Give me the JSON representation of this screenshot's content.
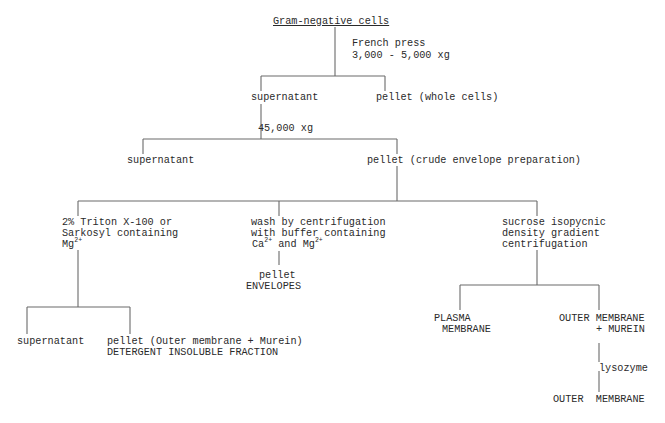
{
  "diagram": {
    "type": "flowchart",
    "title": "Gram-negative cells",
    "nodes": {
      "root": {
        "label": "Gram-negative cells"
      },
      "step1": {
        "line1": "French press",
        "line2": "3,000 - 5,000 xg"
      },
      "sup1": {
        "label": "supernatant"
      },
      "pellet1": {
        "label": "pellet (whole cells)"
      },
      "step2": {
        "label": "45,000 xg"
      },
      "sup2": {
        "label": "supernatant"
      },
      "pellet2": {
        "label": "pellet (crude envelope preparation)"
      },
      "branchA": {
        "line1": "2% Triton X-100 or",
        "line2": "Sarkosyl containing",
        "line3_base": "Mg",
        "line3_sup": "2+"
      },
      "branchB": {
        "line1": "wash by centrifugation",
        "line2": "with buffer containing",
        "line3_a": "Ca",
        "line3_a_sup": "2+",
        "line3_mid": " and",
        "line3_b": "Mg",
        "line3_b_sup": "2+"
      },
      "branchC": {
        "line1": "sucrose isopycnic",
        "line2": "density gradient",
        "line3": "centrifugation"
      },
      "supA": {
        "label": "supernatant"
      },
      "pelletA": {
        "line1": "pellet (Outer membrane + Murein)",
        "line2": "DETERGENT INSOLUBLE FRACTION"
      },
      "pelletB": {
        "line1": "pellet",
        "line2": "ENVELOPES"
      },
      "plasma": {
        "line1": "PLASMA",
        "line2": "MEMBRANE"
      },
      "outerMurein": {
        "line1": "OUTER MEMBRANE",
        "line2": "+ MUREIN"
      },
      "step3": {
        "label": "lysozyme"
      },
      "outer": {
        "label": "OUTER  MEMBRANE"
      }
    },
    "edges": [
      [
        "root",
        "sup1"
      ],
      [
        "root",
        "pellet1"
      ],
      [
        "sup1",
        "sup2"
      ],
      [
        "sup1",
        "pellet2"
      ],
      [
        "pellet2",
        "branchA"
      ],
      [
        "pellet2",
        "branchB"
      ],
      [
        "pellet2",
        "branchC"
      ],
      [
        "branchA",
        "supA"
      ],
      [
        "branchA",
        "pelletA"
      ],
      [
        "branchB",
        "pelletB"
      ],
      [
        "branchC",
        "plasma"
      ],
      [
        "branchC",
        "outerMurein"
      ],
      [
        "outerMurein",
        "outer"
      ]
    ]
  }
}
